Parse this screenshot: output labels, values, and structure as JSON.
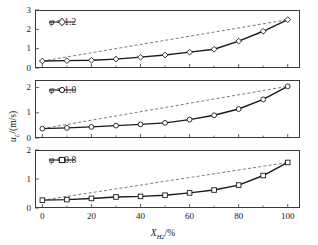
{
  "figure": {
    "background": "#ffffff",
    "line_color": "#1a1a1a",
    "dashed_color": "#6b6b6b",
    "axis_color": "#3a3a3a"
  },
  "axes": {
    "x_title_main": "X",
    "x_title_sub": "H",
    "x_title_sub2": "2",
    "x_title_unit": "/%",
    "y_title_main": "u",
    "y_title_sub": "L",
    "y_title_unit": "/(m/s)",
    "x_ticks": [
      0,
      20,
      40,
      60,
      80,
      100
    ],
    "x_minor_ticks": [
      10,
      30,
      50,
      70,
      90
    ],
    "x_range": [
      -3,
      105
    ]
  },
  "chart_data": [
    {
      "type": "line",
      "panel": 1,
      "legend": "φ = 1.2",
      "legend_phi": "φ",
      "legend_rest": " = 1.2",
      "marker": "diamond",
      "xlabel": "X_H2/%",
      "ylabel": "u_L/(m/s)",
      "ylim": [
        0,
        3
      ],
      "y_ticks": [
        0,
        1,
        2,
        3
      ],
      "x": [
        0,
        10,
        20,
        30,
        40,
        50,
        60,
        70,
        80,
        90,
        100
      ],
      "values": [
        0.36,
        0.38,
        0.4,
        0.46,
        0.56,
        0.67,
        0.82,
        0.97,
        1.39,
        1.9,
        2.5
      ],
      "dashed_reference": {
        "name": "linear-reference",
        "x": [
          0,
          100
        ],
        "values": [
          0.36,
          2.5
        ]
      },
      "grid": false
    },
    {
      "type": "line",
      "panel": 2,
      "legend": "φ = 1.0",
      "legend_phi": "φ",
      "legend_rest": " = 1.0",
      "marker": "circle",
      "xlabel": "X_H2/%",
      "ylabel": "u_L/(m/s)",
      "ylim": [
        0,
        2.3
      ],
      "y_ticks": [
        0,
        1,
        2
      ],
      "x": [
        0,
        10,
        20,
        30,
        40,
        50,
        60,
        70,
        80,
        90,
        100
      ],
      "values": [
        0.37,
        0.4,
        0.44,
        0.49,
        0.54,
        0.6,
        0.73,
        0.9,
        1.15,
        1.53,
        2.05
      ],
      "dashed_reference": {
        "name": "linear-reference",
        "x": [
          0,
          100
        ],
        "values": [
          0.37,
          2.05
        ]
      },
      "grid": false
    },
    {
      "type": "line",
      "panel": 3,
      "legend": "φ = 0.8",
      "legend_phi": "φ",
      "legend_rest": " = 0.8",
      "marker": "square",
      "xlabel": "X_H2/%",
      "ylabel": "u_L/(m/s)",
      "ylim": [
        0,
        2
      ],
      "y_ticks": [
        0,
        1,
        2
      ],
      "x": [
        0,
        10,
        20,
        30,
        40,
        50,
        60,
        70,
        80,
        90,
        100
      ],
      "values": [
        0.27,
        0.29,
        0.33,
        0.38,
        0.4,
        0.44,
        0.52,
        0.62,
        0.79,
        1.12,
        1.57
      ],
      "dashed_reference": {
        "name": "linear-reference",
        "x": [
          0,
          100
        ],
        "values": [
          0.27,
          1.57
        ]
      },
      "grid": false
    }
  ]
}
